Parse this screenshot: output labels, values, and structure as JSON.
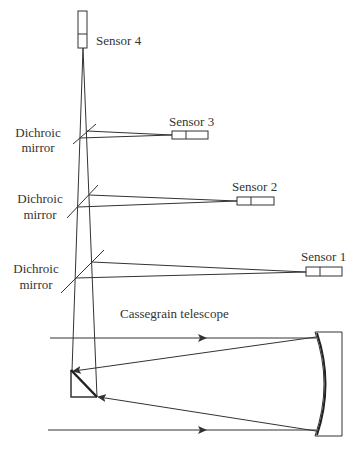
{
  "diagram": {
    "colors": {
      "line": "#333333",
      "background": "#ffffff"
    },
    "sensors": [
      {
        "label": "Sensor 1"
      },
      {
        "label": "Sensor 2"
      },
      {
        "label": "Sensor 3"
      },
      {
        "label": "Sensor 4"
      }
    ],
    "dichroic_mirrors": [
      {
        "line1": "Dichroic",
        "line2": "mirror"
      },
      {
        "line1": "Dichroic",
        "line2": "mirror"
      },
      {
        "line1": "Dichroic",
        "line2": "mirror"
      }
    ],
    "telescope": {
      "label": "Cassegrain telescope"
    }
  }
}
